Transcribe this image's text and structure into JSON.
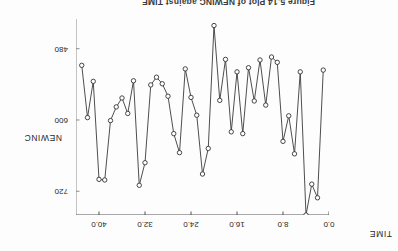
{
  "figure": {
    "caption": "Figure 5.14  Plot of NEWINC against TIME",
    "rotation_note": "180"
  },
  "chart_data": {
    "type": "line",
    "title": "",
    "xlabel": "TIME",
    "ylabel": "NEWINC",
    "xlim": [
      0.0,
      44.0
    ],
    "ylim": [
      430.0,
      760.0
    ],
    "y_inverted": true,
    "grid": false,
    "legend": null,
    "marker": "circle-open",
    "xticks": [
      "0.0",
      "8.0",
      "16.0",
      "24.0",
      "32.0",
      "40.0"
    ],
    "xtick_values": [
      0.0,
      8.0,
      16.0,
      24.0,
      32.0,
      40.0
    ],
    "yticks": [
      "480",
      "600",
      "720"
    ],
    "ytick_values": [
      480,
      600,
      720
    ],
    "x": [
      1,
      2,
      3,
      4,
      5,
      6,
      7,
      8,
      9,
      10,
      11,
      12,
      13,
      14,
      15,
      16,
      17,
      18,
      19,
      20,
      21,
      22,
      23,
      24,
      25,
      26,
      27,
      28,
      29,
      30,
      31,
      32,
      33,
      34,
      35,
      36,
      37,
      38,
      39,
      40,
      41,
      42,
      43
    ],
    "values": [
      516,
      731,
      708,
      760,
      519,
      657,
      593,
      636,
      503,
      494,
      575,
      499,
      568,
      512,
      623,
      519,
      620,
      498,
      567,
      441,
      648,
      691,
      592,
      562,
      514,
      655,
      623,
      560,
      539,
      528,
      541,
      672,
      710,
      534,
      589,
      563,
      578,
      601,
      701,
      700,
      535,
      596,
      508
    ],
    "series": [
      {
        "name": "NEWINC",
        "values": [
          516,
          731,
          708,
          760,
          519,
          657,
          593,
          636,
          503,
          494,
          575,
          499,
          568,
          512,
          623,
          519,
          620,
          498,
          567,
          441,
          648,
          691,
          592,
          562,
          514,
          655,
          623,
          560,
          539,
          528,
          541,
          672,
          710,
          534,
          589,
          563,
          578,
          601,
          701,
          700,
          535,
          596,
          508
        ]
      }
    ]
  }
}
